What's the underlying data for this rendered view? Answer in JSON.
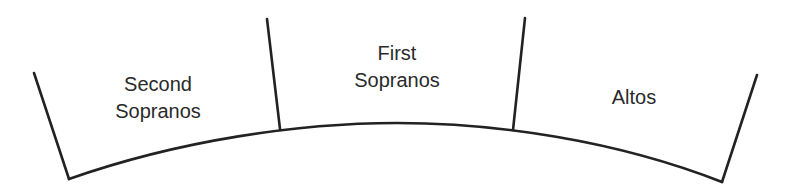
{
  "diagram": {
    "type": "choir-seating-arrangement",
    "line_color": "#222222",
    "text_color": "#2a2a2a",
    "background": "#ffffff",
    "sections": [
      {
        "name": "second-sopranos",
        "line1": "Second",
        "line2": "Sopranos",
        "position": "left"
      },
      {
        "name": "first-sopranos",
        "line1": "First",
        "line2": "Sopranos",
        "position": "center"
      },
      {
        "name": "altos",
        "line1": "Altos",
        "position": "right"
      }
    ],
    "geometry": {
      "left_edge": {
        "top": [
          34,
          73
        ],
        "bottom": [
          69,
          179
        ]
      },
      "divider_1": {
        "top": [
          267,
          19
        ],
        "bottom": [
          280,
          129
        ]
      },
      "divider_2": {
        "top": [
          525,
          18
        ],
        "bottom": [
          513,
          130
        ]
      },
      "right_edge": {
        "top": [
          757,
          75
        ],
        "bottom": [
          722,
          182
        ]
      },
      "arc": {
        "start": [
          69,
          179
        ],
        "apex": [
          397,
          123
        ],
        "end": [
          722,
          182
        ]
      }
    }
  }
}
